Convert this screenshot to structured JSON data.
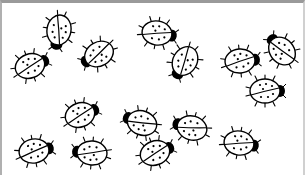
{
  "illustration": {
    "subject": "ladybugs",
    "count": 15,
    "stroke_color": "#000000",
    "fill_color": "#ffffff",
    "frame_color": "#9a9a9a"
  },
  "ladybugs": [
    {
      "x": 28,
      "y": 63,
      "angle": -20
    },
    {
      "x": 57,
      "y": 27,
      "angle": 100
    },
    {
      "x": 97,
      "y": 51,
      "angle": 150
    },
    {
      "x": 155,
      "y": 30,
      "angle": 10
    },
    {
      "x": 183,
      "y": 58,
      "angle": 120
    },
    {
      "x": 238,
      "y": 58,
      "angle": -5
    },
    {
      "x": 280,
      "y": 48,
      "angle": -130
    },
    {
      "x": 263,
      "y": 88,
      "angle": 0
    },
    {
      "x": 78,
      "y": 112,
      "angle": -20
    },
    {
      "x": 140,
      "y": 120,
      "angle": 200
    },
    {
      "x": 190,
      "y": 125,
      "angle": 195
    },
    {
      "x": 237,
      "y": 140,
      "angle": 10
    },
    {
      "x": 32,
      "y": 148,
      "angle": -10
    },
    {
      "x": 90,
      "y": 150,
      "angle": 185
    },
    {
      "x": 153,
      "y": 150,
      "angle": -20
    }
  ]
}
